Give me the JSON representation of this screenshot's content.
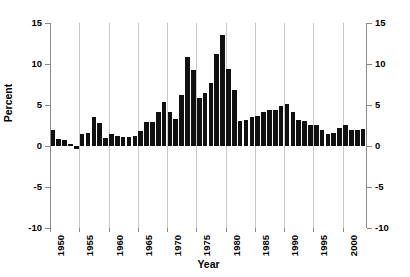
{
  "chart_data": {
    "type": "bar",
    "title": "",
    "xlabel": "Year",
    "ylabel": "Percent",
    "ylim": [
      -10,
      15
    ],
    "xlim": [
      1950,
      2004
    ],
    "ytick_labels_left": [
      "15",
      "10",
      "5",
      "0",
      "-5",
      "-10"
    ],
    "ytick_labels_right": [
      "15",
      "10",
      "5",
      "0",
      "-5",
      "-10"
    ],
    "ytick_values": [
      15,
      10,
      5,
      0,
      -5,
      -10
    ],
    "xtick_labels": [
      "1950",
      "1955",
      "1960",
      "1965",
      "1970",
      "1975",
      "1980",
      "1985",
      "1990",
      "1995",
      "2000"
    ],
    "xtick_values": [
      1950,
      1955,
      1960,
      1965,
      1970,
      1975,
      1980,
      1985,
      1990,
      1995,
      2000
    ],
    "grid": "vertical gridlines at every 5-year tick from 1955 to 2000",
    "legend": "none",
    "bar_color": "#101010",
    "axis_color": "#8a8a8a",
    "gridline_color": "#c9c9c9",
    "categories": [
      1950,
      1951,
      1952,
      1953,
      1954,
      1955,
      1956,
      1957,
      1958,
      1959,
      1960,
      1961,
      1962,
      1963,
      1964,
      1965,
      1966,
      1967,
      1968,
      1969,
      1970,
      1971,
      1972,
      1973,
      1974,
      1975,
      1976,
      1977,
      1978,
      1979,
      1980,
      1981,
      1982,
      1983,
      1984,
      1985,
      1986,
      1987,
      1988,
      1989,
      1990,
      1991,
      1992,
      1993,
      1994,
      1995,
      1996,
      1997,
      1998,
      1999,
      2000,
      2001,
      2002,
      2003
    ],
    "values": [
      2.0,
      0.8,
      0.7,
      0.2,
      -0.4,
      1.5,
      1.6,
      3.5,
      2.8,
      1.0,
      1.5,
      1.2,
      1.1,
      1.1,
      1.2,
      1.8,
      2.9,
      2.9,
      4.2,
      5.4,
      4.2,
      3.3,
      6.2,
      10.8,
      9.3,
      5.8,
      6.5,
      7.7,
      11.2,
      13.5,
      9.4,
      6.8,
      3.1,
      3.2,
      3.5,
      3.6,
      4.1,
      4.4,
      4.4,
      4.9,
      5.1,
      4.2,
      3.2,
      3.0,
      2.6,
      2.6,
      2.0,
      1.5,
      1.6,
      2.2,
      2.6,
      1.9,
      1.9,
      2.1
    ]
  }
}
